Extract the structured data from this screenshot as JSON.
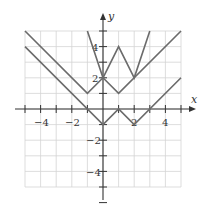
{
  "chart_data": {
    "type": "line",
    "title": "",
    "xlabel": "x",
    "ylabel": "y",
    "xlim": [
      -5,
      5
    ],
    "ylim": [
      -5,
      5
    ],
    "grid": true,
    "x_tick_labels": [
      "-4",
      "-2",
      "2",
      "4"
    ],
    "y_tick_labels": [
      "4",
      "2",
      "-2",
      "-4"
    ],
    "series": [
      {
        "name": "steep-w-curve",
        "points": [
          [
            -1,
            5
          ],
          [
            0,
            2
          ],
          [
            1,
            4
          ],
          [
            2,
            2
          ],
          [
            3,
            5
          ]
        ]
      },
      {
        "name": "middle-w-curve",
        "points": [
          [
            -5,
            5
          ],
          [
            -1,
            1
          ],
          [
            0,
            2
          ],
          [
            1,
            1
          ],
          [
            5,
            5
          ]
        ]
      },
      {
        "name": "lower-w-curve",
        "points": [
          [
            -5,
            4
          ],
          [
            0,
            -1
          ],
          [
            1,
            0
          ],
          [
            2,
            -1
          ],
          [
            5,
            2
          ]
        ]
      }
    ],
    "colors": {
      "curve": "#6b6b6b",
      "axis": "#333333",
      "grid": "#d4d4d4"
    }
  },
  "axes": {
    "x_label": "x",
    "y_label": "y",
    "x_ticks": [
      {
        "value": -4,
        "label": "−4"
      },
      {
        "value": -2,
        "label": "−2"
      },
      {
        "value": 2,
        "label": "2"
      },
      {
        "value": 4,
        "label": "4"
      }
    ],
    "y_ticks": [
      {
        "value": 4,
        "label": "4"
      },
      {
        "value": 2,
        "label": "2"
      },
      {
        "value": -2,
        "label": "−2"
      },
      {
        "value": -4,
        "label": "−4"
      }
    ]
  }
}
